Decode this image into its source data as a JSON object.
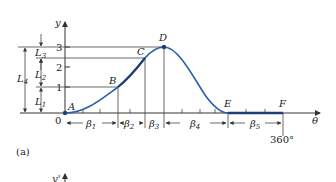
{
  "figure": {
    "panel_label": "(a)",
    "next_panel_axis_label": "y'",
    "axes": {
      "y_label": "y",
      "x_label": "θ",
      "origin_label": "0",
      "y_ticks": [
        "1",
        "2",
        "3"
      ],
      "x_end_label": "360°"
    },
    "points": [
      {
        "name": "A",
        "label": "A"
      },
      {
        "name": "B",
        "label": "B"
      },
      {
        "name": "C",
        "label": "C"
      },
      {
        "name": "D",
        "label": "D"
      },
      {
        "name": "E",
        "label": "E"
      },
      {
        "name": "F",
        "label": "F"
      }
    ],
    "lifts": [
      {
        "label": "L",
        "sub": "1"
      },
      {
        "label": "L",
        "sub": "2"
      },
      {
        "label": "L",
        "sub": "3"
      },
      {
        "label": "L",
        "sub": "4"
      }
    ],
    "intervals": [
      {
        "label": "β",
        "sub": "1"
      },
      {
        "label": "β",
        "sub": "2"
      },
      {
        "label": "β",
        "sub": "3"
      },
      {
        "label": "β",
        "sub": "4"
      },
      {
        "label": "β",
        "sub": "5"
      }
    ],
    "colors": {
      "curve": "#2a5fa8",
      "dwell": "#1e3f73",
      "ink": "#333333"
    }
  }
}
